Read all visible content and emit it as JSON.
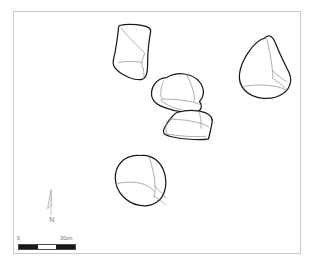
{
  "figure": {
    "kind": "archaeological-site-plan",
    "caption": "",
    "background_color": "#ffffff",
    "frame_color": "#c9c9cd"
  },
  "plan": {
    "outline_color": "#1a1a1a",
    "detail_color": "#8d8d93",
    "fill_color": "#ffffff",
    "features": [
      {
        "id": "stone-top-left",
        "label": "stone-top-left",
        "description": "elongated rounded quadrilateral stone, upper left of cluster"
      },
      {
        "id": "stone-center",
        "label": "stone-center",
        "description": "rounded blocky stone, centre of cluster"
      },
      {
        "id": "stone-lower-center",
        "label": "stone-lower-center",
        "description": "wide low wedge-shaped stone below centre stone"
      },
      {
        "id": "stone-right",
        "label": "stone-right",
        "description": "teardrop / pear shaped stone, right side of plan"
      },
      {
        "id": "stone-bottom",
        "label": "stone-bottom",
        "description": "rounded ovoid stone, lower left-centre of plan"
      }
    ]
  },
  "north_arrow": {
    "label": "N",
    "color": "#b3b3b8"
  },
  "scale_bar": {
    "min_label": "0",
    "max_label": "30cm",
    "units": "cm",
    "total_length": 30,
    "segments": [
      "dark",
      "light",
      "dark"
    ],
    "dark_color": "#18181a",
    "light_color": "#ffffff"
  }
}
